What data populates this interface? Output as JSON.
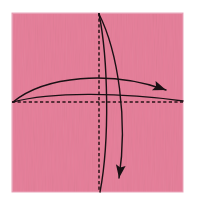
{
  "canvas": {
    "width": 198,
    "height": 212,
    "background": "#ffffff"
  },
  "diagram": {
    "kind": "origami-fold-diagram",
    "step_label": "",
    "paper": {
      "name": "square-origami-paper",
      "fill": "#f2b4c6",
      "edge_shade": "#e79fb4",
      "x": 12,
      "y": 13,
      "width": 171,
      "height": 179
    },
    "crease_color": "#2b1418",
    "arrow_color": "#1a1014",
    "creases": [
      {
        "name": "vertical-center-crease",
        "orientation": "vertical",
        "style": "dashed",
        "x1": 99,
        "y1": 13,
        "x2": 99,
        "y2": 192
      },
      {
        "name": "horizontal-center-crease",
        "orientation": "horizontal",
        "style": "dashed",
        "x1": 12,
        "y1": 102,
        "x2": 183,
        "y2": 102
      }
    ],
    "fold_arrows": [
      {
        "name": "left-to-right-fold-arrow",
        "direction": "rightward",
        "has_arrowhead": true,
        "path": "M 13 102 C 45 76, 110 70, 166 90",
        "arrowhead_at": {
          "x": 166,
          "y": 90
        },
        "arrowhead_angle_deg": 22
      },
      {
        "name": "left-to-right-return-curve",
        "direction": "rightward",
        "has_arrowhead": false,
        "path": "M 13 102 C 50 92, 120 92, 183 101",
        "arrowhead_at": null,
        "arrowhead_angle_deg": 0
      },
      {
        "name": "top-to-bottom-fold-arrow",
        "direction": "downward",
        "has_arrowhead": true,
        "path": "M 99 14 C 118 52, 128 120, 119 178",
        "arrowhead_at": {
          "x": 119,
          "y": 178
        },
        "arrowhead_angle_deg": 100
      },
      {
        "name": "top-to-bottom-return-curve",
        "direction": "downward",
        "has_arrowhead": false,
        "path": "M 99 14 C 108 58, 110 140, 100 192",
        "arrowhead_at": null,
        "arrowhead_angle_deg": 0
      }
    ],
    "annotations": []
  }
}
